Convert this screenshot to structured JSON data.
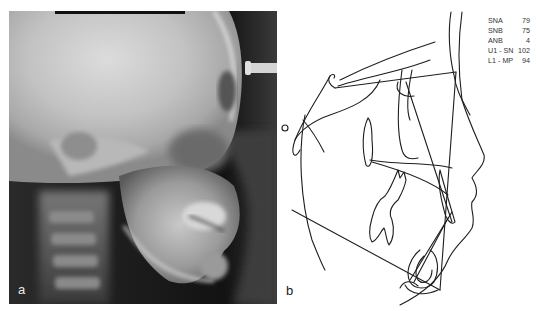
{
  "figure": {
    "panels": [
      {
        "id": "a",
        "label": "a",
        "kind": "lateral cephalometric radiograph"
      },
      {
        "id": "b",
        "label": "b",
        "kind": "cephalometric tracing"
      }
    ],
    "measurements": [
      {
        "name": "SNA",
        "value": "79"
      },
      {
        "name": "SNB",
        "value": "75"
      },
      {
        "name": "ANB",
        "value": "4"
      },
      {
        "name": "U1 - SN",
        "value": "102"
      },
      {
        "name": "L1 - MP",
        "value": "94"
      }
    ],
    "colors": {
      "background": "#ffffff",
      "tracing_line": "#1e1e1e",
      "radiograph_dark": "#141414",
      "radiograph_light": "#d8d8d8"
    }
  }
}
